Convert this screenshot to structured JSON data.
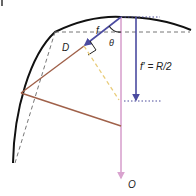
{
  "diagram": {
    "panel_mark": "|",
    "labels": {
      "f": "f",
      "theta": "θ",
      "D": "D",
      "f_prime": "f′ = R/2",
      "O": "O"
    },
    "colors": {
      "arc": "#111111",
      "dashed_guide": "#777777",
      "dotted_guide": "#4a4a9a",
      "focal_arrow": "#4b4ba0",
      "axis_arrow": "#d9a3cf",
      "ray": "#a0614a",
      "perpendicular": "#e9cc7a"
    }
  }
}
